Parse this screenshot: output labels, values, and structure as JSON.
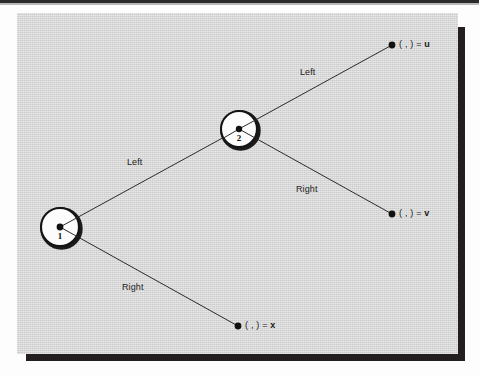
{
  "figure": {
    "type": "binary-decision-tree-diagram",
    "background_color": "#d3d4d3",
    "ink_color": "#231f20",
    "nodes": [
      {
        "id": "node-1",
        "label": "1",
        "cx": 60,
        "cy": 227,
        "r": 19
      },
      {
        "id": "node-2",
        "label": "2",
        "cx": 239,
        "cy": 129,
        "r": 18
      }
    ],
    "leaves": [
      {
        "id": "leaf-u",
        "prefix": "( , ) =",
        "value": "u",
        "cx": 392,
        "cy": 45
      },
      {
        "id": "leaf-v",
        "prefix": "( , ) =",
        "value": "v",
        "cx": 392,
        "cy": 214
      },
      {
        "id": "leaf-x",
        "prefix": "( , ) =",
        "value": "x",
        "cx": 238,
        "cy": 326
      }
    ],
    "edges": [
      {
        "id": "edge-1-left",
        "label": "Left",
        "from": "node-1",
        "to": "node-2",
        "label_x": 127,
        "label_y": 157
      },
      {
        "id": "edge-1-right",
        "label": "Right",
        "from": "node-1",
        "to": "leaf-x",
        "label_x": 122,
        "label_y": 282
      },
      {
        "id": "edge-2-left",
        "label": "Left",
        "from": "node-2",
        "to": "leaf-u",
        "label_x": 300,
        "label_y": 67
      },
      {
        "id": "edge-2-right",
        "label": "Right",
        "from": "node-2",
        "to": "leaf-v",
        "label_x": 296,
        "label_y": 184
      }
    ]
  }
}
